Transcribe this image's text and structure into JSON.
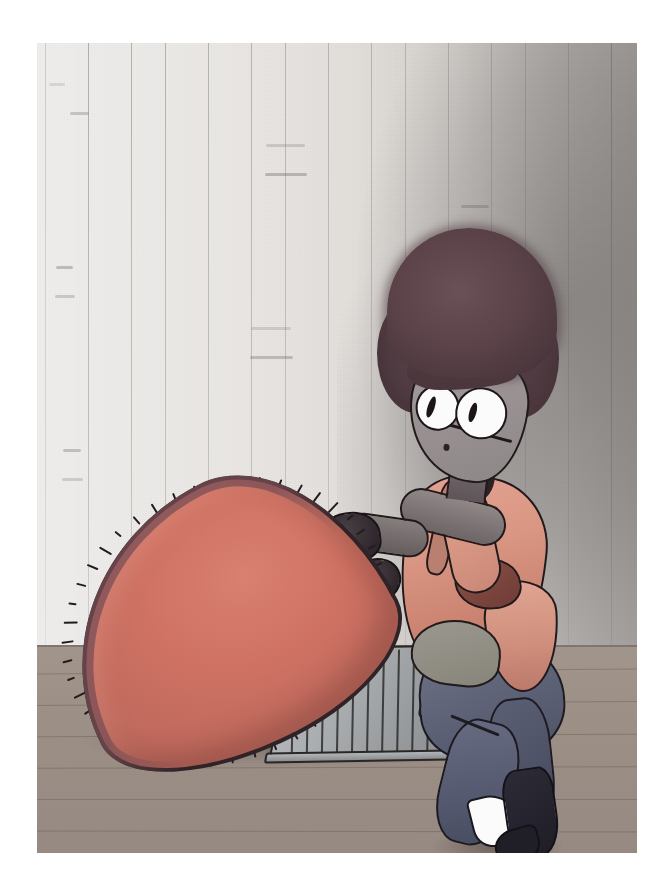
{
  "artwork": {
    "title": "Character with large red furry object on wooden floor",
    "medium_look": "marker and ink illustration, scanned on white paper",
    "paper": {
      "background_color": "#ffffff",
      "image_left": 37,
      "image_top": 43,
      "image_width": 600,
      "image_height": 810
    },
    "palette": {
      "paper_white": "#ffffff",
      "wall_light": "#ddd9d5",
      "wall_shadow": "#7e7a78",
      "floor_brown": "#9c8f86",
      "floor_line": "#50443e",
      "red_object_fill": "#cf7263",
      "red_object_rim": "#7a4d55",
      "outline_black": "#221a1d",
      "hair_brown": "#4c383e",
      "skin_salmon": "#d99683",
      "face_grey": "#9b9393",
      "pants_blue_grey": "#5f6479",
      "boot_dark": "#201f28",
      "tray_grey": "#a8abad",
      "glove_dark": "#2e262b",
      "eye_white": "#fbfbfb"
    },
    "scene": {
      "wall": {
        "name": "vertical plank wall",
        "description": "pale grey vertical wood planks with short horizontal birch-bark dashes, darkening toward the right where the figure casts a shadow",
        "seam_count": 15,
        "seam_spacing_px": 40,
        "dash_count": 18
      },
      "floor": {
        "name": "wooden floor",
        "description": "warm grey-brown plank floor starting below the wall",
        "horizon_y": 602,
        "plank_line_count": 6
      },
      "tray": {
        "name": "ribbed grey tray",
        "description": "metal ribbed tray or grill mat lying flat on the floor with an oval handle slot at its right end",
        "rib_count": 10,
        "has_handle": true
      },
      "red_object": {
        "name": "large red furry pod",
        "description": "oversized teardrop shaped red-orange cushion with a dark purple rim and short black bristles all around the edge, held up by the figure",
        "bristle_count": 46,
        "rotation_deg": -27
      },
      "figure": {
        "name": "kneeling character",
        "description": "young character with tall fluffy dark brown hair, large white eyes, grey-toned face, salmon sleeveless top, blue-grey pants, dark gloves and dark boots, kneeling and lifting the red object",
        "pose": "kneeling on one knee, both arms reaching left",
        "parts": [
          "hair",
          "face",
          "left-eye",
          "right-eye",
          "nose",
          "neck",
          "torso",
          "strap",
          "belly",
          "upper-arm",
          "forearm",
          "glove-left",
          "glove-right",
          "thigh",
          "shin",
          "boot",
          "sock"
        ]
      }
    }
  }
}
